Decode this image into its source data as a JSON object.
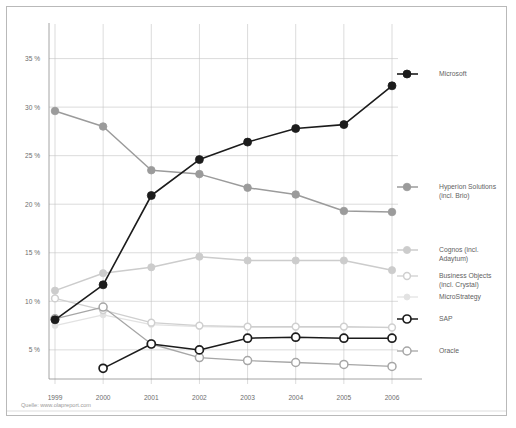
{
  "source": {
    "text": "Quelle: www.olapreport.com"
  },
  "chart_data": {
    "type": "line",
    "title": "",
    "subtitle": "",
    "xlabel": "",
    "ylabel": "",
    "categories": [
      "1999",
      "2000",
      "2001",
      "2002",
      "2003",
      "2004",
      "2005",
      "2006"
    ],
    "x": [
      1999,
      2000,
      2001,
      2002,
      2003,
      2004,
      2005,
      2006
    ],
    "ylim": [
      2.0,
      36.5
    ],
    "yticks": [
      5,
      10,
      15,
      20,
      25,
      30,
      35
    ],
    "ytick_labels": [
      "5 %",
      "10 %",
      "15 %",
      "20 %",
      "25 %",
      "30 %",
      "35 %"
    ],
    "grid": true,
    "legend_position": "right",
    "value_unit": "%",
    "series": [
      {
        "name": "Microsoft",
        "legend_label": "Microsoft",
        "color": "#1c1c1c",
        "marker": "filled-circle",
        "line_width": 1.6,
        "marker_size": 4.0,
        "values": [
          8.1,
          11.7,
          20.9,
          24.6,
          26.4,
          27.8,
          28.2,
          32.2
        ],
        "legend_y": 67
      },
      {
        "name": "Hyperion Solutions (incl. Brio)",
        "legend_label": "Hyperion Solutions",
        "legend_label_2": "(incl. Brio)",
        "color": "#9b9b9b",
        "marker": "filled-circle",
        "line_width": 1.5,
        "marker_size": 3.8,
        "values": [
          29.6,
          28.0,
          23.5,
          23.1,
          21.7,
          21.0,
          19.3,
          19.2
        ],
        "legend_y": 180
      },
      {
        "name": "Cognos (incl. Adaytum)",
        "legend_label": "Cognos (incl.",
        "legend_label_2": "Adaytum)",
        "color": "#cccccc",
        "marker": "filled-circle",
        "line_width": 1.5,
        "marker_size": 3.6,
        "values": [
          11.1,
          12.9,
          13.5,
          14.6,
          14.2,
          14.2,
          14.2,
          13.2
        ],
        "legend_y": 243
      },
      {
        "name": "Business Objects (incl. Crystal)",
        "legend_label": "Business Objects",
        "legend_label_2": "(incl. Crystal)",
        "color": "#cfcfcf",
        "marker": "hollow-circle",
        "line_width": 1.3,
        "marker_size": 3.4,
        "values": [
          10.3,
          9.1,
          7.8,
          7.5,
          7.4,
          7.4,
          7.4,
          7.3
        ],
        "legend_y": 269
      },
      {
        "name": "MicroStrategy",
        "legend_label": "MicroStrategy",
        "color": "#e2e2e2",
        "marker": "filled-circle",
        "line_width": 1.2,
        "marker_size": 3.0,
        "values": [
          7.5,
          8.6,
          7.6,
          7.4,
          7.3,
          7.3,
          7.3,
          7.3
        ],
        "legend_y": 290
      },
      {
        "name": "SAP",
        "legend_label": "SAP",
        "color": "#1c1c1c",
        "marker": "hollow-circle",
        "line_width": 1.5,
        "marker_size": 4.0,
        "values": [
          null,
          3.1,
          5.6,
          5.0,
          6.2,
          6.3,
          6.2,
          6.2
        ],
        "legend_y": 312
      },
      {
        "name": "Oracle",
        "legend_label": "Oracle",
        "color": "#a6a6a6",
        "marker": "hollow-circle",
        "line_width": 1.3,
        "marker_size": 4.0,
        "values": [
          8.2,
          9.4,
          5.6,
          4.2,
          3.9,
          3.7,
          3.5,
          3.3
        ],
        "legend_y": 344
      }
    ]
  }
}
